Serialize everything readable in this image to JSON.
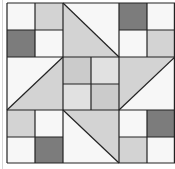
{
  "figure": {
    "type": "quilt-block",
    "grid": {
      "cols": 6,
      "rows": 6
    },
    "colors": {
      "white": "#f7f7f7",
      "light": "#d3d3d3",
      "dark": "#7c7c7c",
      "center_a": "#cbcbcb",
      "center_b": "#e1e1e1",
      "line": "#222222"
    },
    "corner_blocks": [
      {
        "name": "top-left",
        "cells": [
          "white",
          "light",
          "dark",
          "white"
        ]
      },
      {
        "name": "top-right",
        "cells": [
          "dark",
          "white",
          "white",
          "light"
        ]
      },
      {
        "name": "bottom-left",
        "cells": [
          "light",
          "white",
          "white",
          "dark"
        ]
      },
      {
        "name": "bottom-right",
        "cells": [
          "white",
          "dark",
          "light",
          "white"
        ]
      }
    ],
    "center_cells": [
      "center_a",
      "center_b",
      "center_b",
      "center_a"
    ],
    "triangles": [
      {
        "name": "top",
        "shaded": "lower-left"
      },
      {
        "name": "left",
        "shaded": "lower-right"
      },
      {
        "name": "right",
        "shaded": "upper-left"
      },
      {
        "name": "bottom",
        "shaded": "upper-right"
      }
    ]
  }
}
